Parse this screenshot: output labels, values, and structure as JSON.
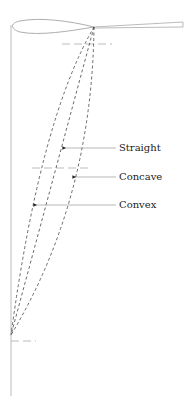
{
  "diagram": {
    "title": "",
    "labels": {
      "straight": "Straight",
      "concave": "Concave",
      "convex": "Convex"
    },
    "colors": {
      "outline": "#999999",
      "dashed_curves": "#444444",
      "ref_lines": "#aaaaaa",
      "text": "#222222"
    }
  }
}
